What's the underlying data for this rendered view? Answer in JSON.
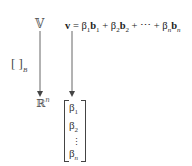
{
  "diagram": {
    "domain_space": {
      "symbol": "𝕍"
    },
    "codomain_space": {
      "symbol": "ℝ",
      "superscript": "n"
    },
    "coordinate_map": {
      "brackets": "[ ]",
      "subscript": "B"
    },
    "equation": {
      "lhs": "v",
      "equals": "=",
      "terms": [
        {
          "coef": "β",
          "coef_sub": "1",
          "basis": "b",
          "basis_sub": "1"
        },
        {
          "coef": "β",
          "coef_sub": "2",
          "basis": "b",
          "basis_sub": "2"
        },
        {
          "coef": "β",
          "coef_sub": "n",
          "basis": "b",
          "basis_sub": "n"
        }
      ],
      "plus": "+",
      "ellipsis": "⋯"
    },
    "coordinate_vector": {
      "entries": [
        {
          "sym": "β",
          "sub": "1"
        },
        {
          "sym": "β",
          "sub": "2"
        },
        {
          "sym": "β",
          "sub": "n"
        }
      ],
      "vdots": "⋮"
    },
    "arrow_color": "#666666"
  }
}
